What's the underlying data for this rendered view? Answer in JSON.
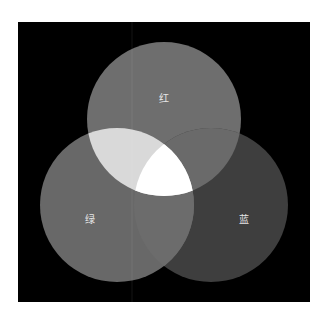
{
  "diagram": {
    "type": "venn",
    "background": "#000000",
    "circles": [
      {
        "id": "red",
        "label": "红",
        "cx": 164,
        "cy": 119,
        "r": 77,
        "color": "#6e6e6e"
      },
      {
        "id": "green",
        "label": "绿",
        "cx": 117,
        "cy": 205,
        "r": 77,
        "color": "#686868"
      },
      {
        "id": "blue",
        "label": "蓝",
        "cx": 211,
        "cy": 205,
        "r": 77,
        "color": "#3e3e3e"
      }
    ],
    "overlaps": {
      "red_green": "#d9d9d9",
      "red_blue": "#6a6a6a",
      "green_blue": "#6c6c6c",
      "red_green_blue": "#ffffff"
    }
  }
}
